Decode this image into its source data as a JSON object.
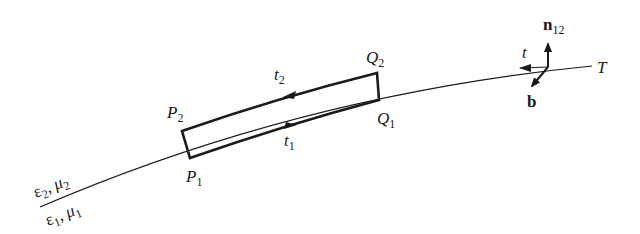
{
  "figure": {
    "type": "boundary-interface-loop",
    "media": {
      "upper": {
        "eps": "ε",
        "eps_sub": "2",
        "sep": ", ",
        "mu": "μ",
        "mu_sub": "2"
      },
      "lower": {
        "eps": "ε",
        "eps_sub": "1",
        "sep": ", ",
        "mu": "μ",
        "mu_sub": "1"
      }
    },
    "points": {
      "P1": {
        "main": "P",
        "sub": "1"
      },
      "P2": {
        "main": "P",
        "sub": "2"
      },
      "Q1": {
        "main": "Q",
        "sub": "1"
      },
      "Q2": {
        "main": "Q",
        "sub": "2"
      }
    },
    "tangents": {
      "t1": {
        "main": "t",
        "sub": "1"
      },
      "t2": {
        "main": "t",
        "sub": "2"
      },
      "t": {
        "main": "t"
      }
    },
    "vectors": {
      "normal": {
        "main": "n",
        "sub": "12"
      },
      "binormal": {
        "main": "b"
      }
    },
    "curve_label": "T",
    "colors": {
      "ink": "#1a1a1a",
      "background": "#ffffff"
    }
  }
}
